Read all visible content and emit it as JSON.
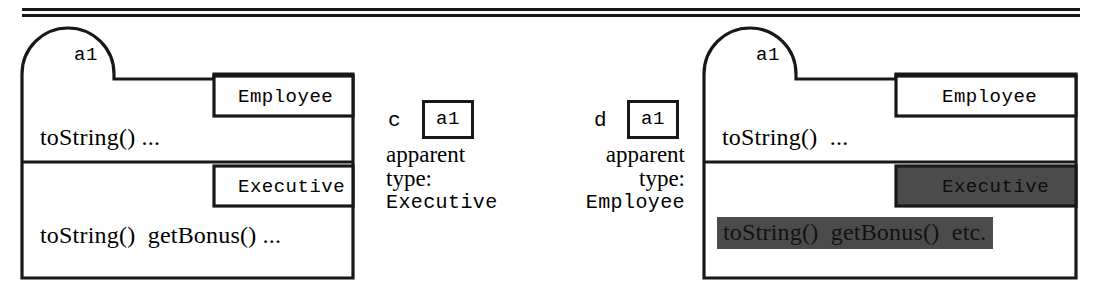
{
  "figure": {
    "object_id": "a1",
    "rule_present": true
  },
  "left_diagram": {
    "name": "object-a1-executive-apparent",
    "dome_label": "a1",
    "partitions": [
      {
        "class_name": "Employee",
        "methods": "toString() ...",
        "shaded": false
      },
      {
        "class_name": "Executive",
        "methods": "toString()  getBonus() ...",
        "shaded": false
      }
    ]
  },
  "callout_c": {
    "tag": "c",
    "chip_text": "a1",
    "line1": "apparent",
    "line2": "type:",
    "line3": "Executive"
  },
  "callout_d": {
    "tag": "d",
    "chip_text": "a1",
    "line1": "apparent",
    "line2": "type:",
    "line3": "Employee"
  },
  "right_diagram": {
    "name": "object-a1-employee-apparent",
    "dome_label": "a1",
    "partitions": [
      {
        "class_name": "Employee",
        "methods": "toString()  ...",
        "shaded": false
      },
      {
        "class_name": "Executive",
        "methods": "toString()  getBonus()  etc.",
        "shaded": true
      }
    ]
  },
  "colors": {
    "ink": "#17181a",
    "paper": "#ffffff",
    "shade": "#4b4b4b"
  }
}
